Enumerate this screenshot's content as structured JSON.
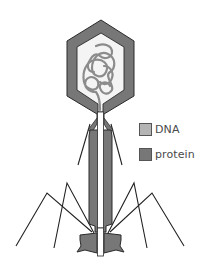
{
  "diagram": {
    "parts": [
      "head",
      "dna-coil",
      "collar",
      "tail-sheath",
      "core-tube",
      "base-plate",
      "tail-fibers"
    ]
  },
  "legend": {
    "items": [
      {
        "label": "DNA",
        "color": "#b4b4b4"
      },
      {
        "label": "protein",
        "color": "#777777"
      }
    ]
  },
  "colors": {
    "protein": "#777777",
    "dna": "#9a9a9a",
    "inner": "#f2f2f2",
    "outline": "#2a2a2a",
    "background": "#ffffff"
  }
}
